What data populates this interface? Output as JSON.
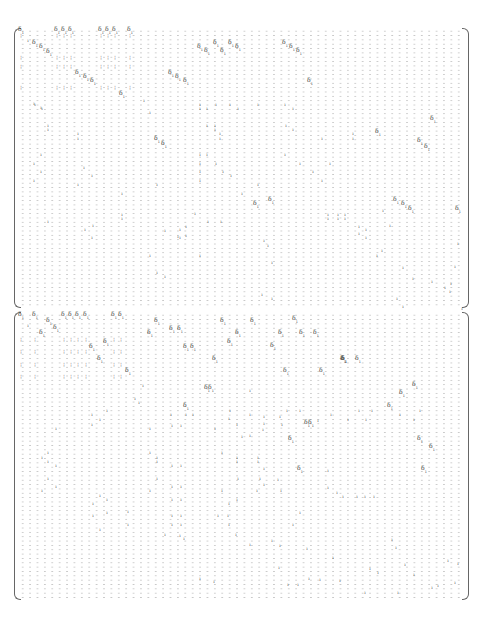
{
  "document": {
    "type": "sparse-matrix",
    "blocks": [
      {
        "name": "top-matrix",
        "top": 28,
        "height": 280,
        "cols": 60,
        "rows": 64
      },
      {
        "name": "bottom-matrix",
        "top": 312,
        "height": 288,
        "cols": 60,
        "rows": 66
      }
    ],
    "placeholder_glyph": "·",
    "glyphs": {
      "big": "δ",
      "big_sub": "1",
      "small": "ı",
      "pair": "¦"
    }
  },
  "entries_top": [
    [
      21,
      31,
      "big"
    ],
    [
      57,
      31,
      "big"
    ],
    [
      64,
      31,
      "big"
    ],
    [
      71,
      31,
      "big"
    ],
    [
      101,
      31,
      "big"
    ],
    [
      108,
      31,
      "big"
    ],
    [
      115,
      31,
      "big"
    ],
    [
      130,
      31,
      "big"
    ],
    [
      21,
      35,
      "pair"
    ],
    [
      57,
      35,
      "pair"
    ],
    [
      64,
      35,
      "pair"
    ],
    [
      71,
      35,
      "pair"
    ],
    [
      101,
      35,
      "pair"
    ],
    [
      108,
      35,
      "pair"
    ],
    [
      115,
      35,
      "pair"
    ],
    [
      130,
      35,
      "pair"
    ],
    [
      28,
      40,
      "small"
    ],
    [
      35,
      44,
      "big"
    ],
    [
      42,
      48,
      "big"
    ],
    [
      49,
      53,
      "big"
    ],
    [
      21,
      57,
      "pair"
    ],
    [
      57,
      57,
      "pair"
    ],
    [
      64,
      57,
      "pair"
    ],
    [
      71,
      57,
      "pair"
    ],
    [
      101,
      57,
      "pair"
    ],
    [
      108,
      57,
      "pair"
    ],
    [
      115,
      57,
      "pair"
    ],
    [
      130,
      57,
      "pair"
    ],
    [
      21,
      66,
      "pair"
    ],
    [
      57,
      66,
      "pair"
    ],
    [
      64,
      66,
      "pair"
    ],
    [
      71,
      66,
      "pair"
    ],
    [
      101,
      66,
      "pair"
    ],
    [
      108,
      66,
      "pair"
    ],
    [
      115,
      66,
      "pair"
    ],
    [
      130,
      66,
      "pair"
    ],
    [
      78,
      74,
      "big"
    ],
    [
      86,
      78,
      "big"
    ],
    [
      93,
      82,
      "big"
    ],
    [
      21,
      87,
      "pair"
    ],
    [
      57,
      87,
      "pair"
    ],
    [
      64,
      87,
      "pair"
    ],
    [
      71,
      87,
      "pair"
    ],
    [
      101,
      87,
      "pair"
    ],
    [
      108,
      87,
      "pair"
    ],
    [
      115,
      87,
      "pair"
    ],
    [
      130,
      87,
      "pair"
    ],
    [
      122,
      95,
      "big"
    ],
    [
      144,
      100,
      "small"
    ],
    [
      35,
      104,
      "small"
    ],
    [
      42,
      108,
      "small"
    ],
    [
      150,
      112,
      "small"
    ],
    [
      200,
      48,
      "big"
    ],
    [
      207,
      52,
      "big"
    ],
    [
      216,
      44,
      "big"
    ],
    [
      223,
      52,
      "big"
    ],
    [
      231,
      44,
      "big"
    ],
    [
      238,
      48,
      "big"
    ],
    [
      285,
      44,
      "big"
    ],
    [
      292,
      48,
      "big"
    ],
    [
      299,
      52,
      "big"
    ],
    [
      171,
      74,
      "big"
    ],
    [
      178,
      78,
      "big"
    ],
    [
      186,
      82,
      "big"
    ],
    [
      310,
      82,
      "big"
    ],
    [
      200,
      108,
      "small"
    ],
    [
      216,
      104,
      "small"
    ],
    [
      230,
      104,
      "small"
    ],
    [
      238,
      108,
      "small"
    ],
    [
      285,
      104,
      "small"
    ],
    [
      293,
      108,
      "small"
    ],
    [
      34,
      103,
      "small"
    ],
    [
      41,
      107,
      "small"
    ],
    [
      200,
      104,
      "small"
    ],
    [
      207,
      108,
      "small"
    ],
    [
      258,
      104,
      "small"
    ],
    [
      48,
      125,
      "small"
    ],
    [
      48,
      129,
      "small"
    ],
    [
      78,
      133,
      "small"
    ],
    [
      78,
      138,
      "small"
    ],
    [
      207,
      125,
      "small"
    ],
    [
      215,
      125,
      "small"
    ],
    [
      215,
      129,
      "small"
    ],
    [
      220,
      133,
      "small"
    ],
    [
      220,
      138,
      "small"
    ],
    [
      286,
      125,
      "small"
    ],
    [
      293,
      129,
      "small"
    ],
    [
      322,
      138,
      "small"
    ],
    [
      353,
      133,
      "small"
    ],
    [
      353,
      138,
      "small"
    ],
    [
      157,
      140,
      "big"
    ],
    [
      164,
      145,
      "big"
    ],
    [
      378,
      133,
      "big"
    ],
    [
      420,
      142,
      "big"
    ],
    [
      427,
      148,
      "big"
    ],
    [
      433,
      120,
      "big"
    ],
    [
      41,
      154,
      "small"
    ],
    [
      34,
      163,
      "small"
    ],
    [
      41,
      171,
      "small"
    ],
    [
      34,
      180,
      "small"
    ],
    [
      84,
      167,
      "small"
    ],
    [
      92,
      175,
      "small"
    ],
    [
      200,
      154,
      "small"
    ],
    [
      200,
      163,
      "small"
    ],
    [
      200,
      171,
      "small"
    ],
    [
      200,
      180,
      "small"
    ],
    [
      207,
      154,
      "small"
    ],
    [
      216,
      163,
      "small"
    ],
    [
      223,
      171,
      "small"
    ],
    [
      231,
      175,
      "small"
    ],
    [
      285,
      154,
      "small"
    ],
    [
      300,
      163,
      "small"
    ],
    [
      313,
      171,
      "small"
    ],
    [
      322,
      180,
      "small"
    ],
    [
      330,
      163,
      "small"
    ],
    [
      78,
      184,
      "small"
    ],
    [
      122,
      193,
      "small"
    ],
    [
      157,
      184,
      "small"
    ],
    [
      242,
      193,
      "small"
    ],
    [
      258,
      184,
      "small"
    ],
    [
      256,
      205,
      "big"
    ],
    [
      271,
      201,
      "big"
    ],
    [
      396,
      201,
      "big"
    ],
    [
      404,
      205,
      "big"
    ],
    [
      411,
      210,
      "big"
    ],
    [
      458,
      210,
      "big"
    ],
    [
      48,
      221,
      "small"
    ],
    [
      85,
      229,
      "small"
    ],
    [
      93,
      225,
      "small"
    ],
    [
      92,
      237,
      "small"
    ],
    [
      122,
      214,
      "small"
    ],
    [
      122,
      218,
      "small"
    ],
    [
      180,
      229,
      "small"
    ],
    [
      186,
      226,
      "small"
    ],
    [
      180,
      237,
      "small"
    ],
    [
      186,
      235,
      "small"
    ],
    [
      195,
      213,
      "small"
    ],
    [
      208,
      221,
      "small"
    ],
    [
      221,
      221,
      "small"
    ],
    [
      165,
      230,
      "small"
    ],
    [
      178,
      236,
      "small"
    ],
    [
      328,
      214,
      "small"
    ],
    [
      338,
      214,
      "small"
    ],
    [
      345,
      214,
      "small"
    ],
    [
      328,
      218,
      "small"
    ],
    [
      338,
      218,
      "small"
    ],
    [
      345,
      218,
      "small"
    ],
    [
      359,
      226,
      "small"
    ],
    [
      359,
      233,
      "small"
    ],
    [
      366,
      229,
      "small"
    ],
    [
      366,
      237,
      "small"
    ],
    [
      383,
      210,
      "small"
    ],
    [
      390,
      225,
      "small"
    ],
    [
      150,
      255,
      "small"
    ],
    [
      157,
      272,
      "small"
    ],
    [
      165,
      276,
      "small"
    ],
    [
      200,
      255,
      "small"
    ],
    [
      264,
      240,
      "small"
    ],
    [
      268,
      245,
      "small"
    ],
    [
      272,
      262,
      "small"
    ],
    [
      377,
      255,
      "small"
    ],
    [
      382,
      250,
      "small"
    ],
    [
      403,
      267,
      "small"
    ],
    [
      413,
      278,
      "small"
    ],
    [
      432,
      281,
      "small"
    ],
    [
      451,
      283,
      "small"
    ],
    [
      455,
      266,
      "small"
    ],
    [
      458,
      243,
      "small"
    ],
    [
      262,
      294,
      "small"
    ],
    [
      272,
      298,
      "small"
    ],
    [
      397,
      298,
      "small"
    ],
    [
      403,
      306,
      "small"
    ],
    [
      445,
      287,
      "small"
    ],
    [
      450,
      291,
      "small"
    ],
    [
      462,
      308,
      "small"
    ]
  ],
  "entries_bottom": [
    [
      21,
      316,
      "big"
    ],
    [
      35,
      316,
      "big"
    ],
    [
      64,
      316,
      "big"
    ],
    [
      71,
      316,
      "big"
    ],
    [
      78,
      316,
      "big"
    ],
    [
      86,
      316,
      "big"
    ],
    [
      114,
      316,
      "big"
    ],
    [
      121,
      316,
      "big"
    ],
    [
      28,
      325,
      "small"
    ],
    [
      49,
      322,
      "big"
    ],
    [
      56,
      329,
      "big"
    ],
    [
      42,
      334,
      "big"
    ],
    [
      157,
      322,
      "big"
    ],
    [
      172,
      330,
      "big"
    ],
    [
      180,
      330,
      "big"
    ],
    [
      150,
      334,
      "big"
    ],
    [
      223,
      322,
      "big"
    ],
    [
      253,
      322,
      "big"
    ],
    [
      238,
      334,
      "big"
    ],
    [
      281,
      334,
      "big"
    ],
    [
      295,
      320,
      "big"
    ],
    [
      302,
      334,
      "big"
    ],
    [
      316,
      334,
      "big"
    ],
    [
      21,
      339,
      "pair"
    ],
    [
      35,
      339,
      "pair"
    ],
    [
      64,
      339,
      "pair"
    ],
    [
      71,
      339,
      "pair"
    ],
    [
      78,
      339,
      "pair"
    ],
    [
      86,
      339,
      "pair"
    ],
    [
      114,
      339,
      "pair"
    ],
    [
      121,
      339,
      "pair"
    ],
    [
      106,
      343,
      "big"
    ],
    [
      92,
      348,
      "big"
    ],
    [
      186,
      348,
      "big"
    ],
    [
      193,
      348,
      "big"
    ],
    [
      230,
      343,
      "big"
    ],
    [
      273,
      347,
      "big"
    ],
    [
      21,
      351,
      "pair"
    ],
    [
      35,
      351,
      "pair"
    ],
    [
      64,
      351,
      "pair"
    ],
    [
      71,
      351,
      "pair"
    ],
    [
      78,
      351,
      "pair"
    ],
    [
      86,
      351,
      "pair"
    ],
    [
      114,
      351,
      "pair"
    ],
    [
      121,
      351,
      "pair"
    ],
    [
      100,
      360,
      "big"
    ],
    [
      215,
      360,
      "big"
    ],
    [
      343,
      360,
      "big"
    ],
    [
      358,
      360,
      "big"
    ],
    [
      344,
      360,
      "big"
    ],
    [
      344,
      360,
      "big"
    ],
    [
      21,
      364,
      "pair"
    ],
    [
      35,
      364,
      "pair"
    ],
    [
      64,
      364,
      "pair"
    ],
    [
      71,
      364,
      "pair"
    ],
    [
      78,
      364,
      "pair"
    ],
    [
      86,
      364,
      "pair"
    ],
    [
      114,
      364,
      "pair"
    ],
    [
      121,
      364,
      "pair"
    ],
    [
      128,
      372,
      "big"
    ],
    [
      286,
      372,
      "big"
    ],
    [
      322,
      372,
      "big"
    ],
    [
      415,
      386,
      "big"
    ],
    [
      21,
      376,
      "pair"
    ],
    [
      35,
      376,
      "pair"
    ],
    [
      64,
      376,
      "pair"
    ],
    [
      71,
      376,
      "pair"
    ],
    [
      78,
      376,
      "pair"
    ],
    [
      86,
      376,
      "pair"
    ],
    [
      114,
      376,
      "pair"
    ],
    [
      121,
      376,
      "pair"
    ],
    [
      143,
      385,
      "small"
    ],
    [
      207,
      389,
      "big"
    ],
    [
      211,
      389,
      "big"
    ],
    [
      250,
      390,
      "small"
    ],
    [
      402,
      394,
      "big"
    ],
    [
      135,
      398,
      "small"
    ],
    [
      139,
      402,
      "small"
    ],
    [
      186,
      407,
      "big"
    ],
    [
      390,
      407,
      "big"
    ],
    [
      107,
      410,
      "small"
    ],
    [
      92,
      414,
      "small"
    ],
    [
      171,
      414,
      "small"
    ],
    [
      186,
      414,
      "small"
    ],
    [
      193,
      414,
      "small"
    ],
    [
      230,
      410,
      "small"
    ],
    [
      250,
      414,
      "small"
    ],
    [
      287,
      410,
      "small"
    ],
    [
      300,
      410,
      "small"
    ],
    [
      359,
      410,
      "small"
    ],
    [
      372,
      410,
      "small"
    ],
    [
      400,
      414,
      "small"
    ],
    [
      420,
      410,
      "small"
    ],
    [
      100,
      419,
      "small"
    ],
    [
      229,
      418,
      "small"
    ],
    [
      264,
      416,
      "small"
    ],
    [
      280,
      416,
      "small"
    ],
    [
      318,
      420,
      "small"
    ],
    [
      331,
      414,
      "small"
    ],
    [
      348,
      419,
      "small"
    ],
    [
      366,
      419,
      "small"
    ],
    [
      414,
      419,
      "small"
    ],
    [
      56,
      428,
      "small"
    ],
    [
      92,
      424,
      "small"
    ],
    [
      150,
      428,
      "small"
    ],
    [
      172,
      425,
      "small"
    ],
    [
      181,
      425,
      "small"
    ],
    [
      215,
      428,
      "small"
    ],
    [
      237,
      424,
      "small"
    ],
    [
      264,
      423,
      "small"
    ],
    [
      282,
      424,
      "small"
    ],
    [
      307,
      424,
      "big"
    ],
    [
      311,
      424,
      "big"
    ],
    [
      242,
      436,
      "small"
    ],
    [
      250,
      435,
      "small"
    ],
    [
      263,
      429,
      "small"
    ],
    [
      291,
      440,
      "big"
    ],
    [
      420,
      440,
      "big"
    ],
    [
      432,
      448,
      "big"
    ],
    [
      48,
      452,
      "small"
    ],
    [
      42,
      457,
      "small"
    ],
    [
      48,
      461,
      "small"
    ],
    [
      56,
      465,
      "small"
    ],
    [
      150,
      452,
      "small"
    ],
    [
      157,
      457,
      "small"
    ],
    [
      157,
      461,
      "small"
    ],
    [
      172,
      465,
      "small"
    ],
    [
      181,
      465,
      "small"
    ],
    [
      222,
      452,
      "small"
    ],
    [
      237,
      457,
      "small"
    ],
    [
      237,
      461,
      "small"
    ],
    [
      258,
      457,
      "small"
    ],
    [
      258,
      461,
      "small"
    ],
    [
      264,
      468,
      "small"
    ],
    [
      300,
      470,
      "big"
    ],
    [
      424,
      470,
      "big"
    ],
    [
      48,
      478,
      "small"
    ],
    [
      56,
      486,
      "small"
    ],
    [
      42,
      490,
      "small"
    ],
    [
      150,
      490,
      "small"
    ],
    [
      157,
      478,
      "small"
    ],
    [
      172,
      486,
      "small"
    ],
    [
      181,
      486,
      "small"
    ],
    [
      222,
      490,
      "small"
    ],
    [
      238,
      478,
      "small"
    ],
    [
      257,
      490,
      "small"
    ],
    [
      264,
      484,
      "small"
    ],
    [
      260,
      478,
      "small"
    ],
    [
      278,
      479,
      "small"
    ],
    [
      281,
      490,
      "small"
    ],
    [
      328,
      470,
      "small"
    ],
    [
      328,
      487,
      "small"
    ],
    [
      343,
      496,
      "small"
    ],
    [
      357,
      496,
      "small"
    ],
    [
      365,
      496,
      "small"
    ],
    [
      374,
      496,
      "small"
    ],
    [
      337,
      492,
      "small"
    ],
    [
      100,
      495,
      "small"
    ],
    [
      107,
      499,
      "small"
    ],
    [
      93,
      503,
      "small"
    ],
    [
      172,
      499,
      "small"
    ],
    [
      181,
      499,
      "small"
    ],
    [
      229,
      503,
      "small"
    ],
    [
      237,
      499,
      "small"
    ],
    [
      93,
      515,
      "small"
    ],
    [
      107,
      512,
      "small"
    ],
    [
      128,
      511,
      "small"
    ],
    [
      172,
      515,
      "small"
    ],
    [
      181,
      515,
      "small"
    ],
    [
      228,
      515,
      "small"
    ],
    [
      300,
      512,
      "small"
    ],
    [
      100,
      529,
      "small"
    ],
    [
      128,
      524,
      "small"
    ],
    [
      172,
      524,
      "small"
    ],
    [
      181,
      524,
      "small"
    ],
    [
      218,
      515,
      "small"
    ],
    [
      229,
      524,
      "small"
    ],
    [
      293,
      524,
      "small"
    ],
    [
      165,
      534,
      "small"
    ],
    [
      180,
      535,
      "small"
    ],
    [
      184,
      538,
      "small"
    ],
    [
      236,
      534,
      "small"
    ],
    [
      250,
      544,
      "small"
    ],
    [
      272,
      540,
      "small"
    ],
    [
      280,
      545,
      "small"
    ],
    [
      392,
      539,
      "small"
    ],
    [
      396,
      547,
      "small"
    ],
    [
      307,
      548,
      "small"
    ],
    [
      333,
      557,
      "small"
    ],
    [
      370,
      568,
      "small"
    ],
    [
      378,
      572,
      "small"
    ],
    [
      405,
      564,
      "small"
    ],
    [
      414,
      574,
      "small"
    ],
    [
      200,
      578,
      "small"
    ],
    [
      214,
      581,
      "small"
    ],
    [
      279,
      567,
      "small"
    ],
    [
      288,
      584,
      "small"
    ],
    [
      298,
      584,
      "small"
    ],
    [
      309,
      578,
      "small"
    ],
    [
      320,
      579,
      "small"
    ],
    [
      340,
      580,
      "small"
    ],
    [
      365,
      592,
      "small"
    ],
    [
      398,
      592,
      "small"
    ],
    [
      438,
      585,
      "small"
    ],
    [
      455,
      582,
      "small"
    ],
    [
      458,
      563,
      "small"
    ],
    [
      432,
      587,
      "small"
    ],
    [
      448,
      560,
      "small"
    ]
  ]
}
